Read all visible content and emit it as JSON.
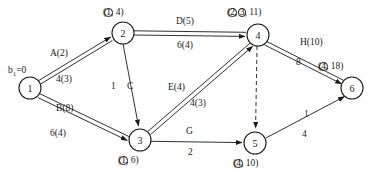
{
  "diagram": {
    "type": "network-flow-diagram",
    "title": "",
    "canvas": {
      "width": 379,
      "height": 180
    },
    "source_label": {
      "text": "b",
      "subscript": "1",
      "value": "=0",
      "full": "b₁=0"
    },
    "nodes": [
      {
        "id": "1",
        "number": "1",
        "cx": 30,
        "cy": 88,
        "r": 11,
        "tag": null
      },
      {
        "id": "2",
        "number": "2",
        "cx": 123,
        "cy": 33,
        "r": 11,
        "tag": {
          "text_before": "(",
          "circled": [
            "1"
          ],
          "plain": "4",
          "full": "(①, 4)"
        }
      },
      {
        "id": "3",
        "number": "3",
        "cx": 140,
        "cy": 140,
        "r": 11,
        "tag": {
          "text_before": "(",
          "circled": [
            "1"
          ],
          "plain": "6",
          "full": "(①, 6)"
        }
      },
      {
        "id": "4",
        "number": "4",
        "cx": 258,
        "cy": 35,
        "r": 11,
        "tag": {
          "text_before": "(",
          "circled": [
            "2",
            "3"
          ],
          "plain": "11",
          "full": "(②, ③, 11)"
        }
      },
      {
        "id": "5",
        "number": "5",
        "cx": 255,
        "cy": 143,
        "r": 11,
        "tag": {
          "text_before": "(",
          "circled": [
            "4"
          ],
          "plain": "10",
          "full": "(④, 10)"
        }
      },
      {
        "id": "6",
        "number": "6",
        "cx": 352,
        "cy": 88,
        "r": 11,
        "tag": {
          "text_before": "(",
          "circled": [
            "4"
          ],
          "plain": "18",
          "full": "(④, 18)"
        }
      }
    ],
    "edges": [
      {
        "id": "e-1-2",
        "from": "1",
        "to": "2",
        "name": "A(2)",
        "value": "4(3)",
        "style": "double",
        "arrow": true
      },
      {
        "id": "e-1-3",
        "from": "1",
        "to": "3",
        "name": "B(8)",
        "value": "6(4)",
        "style": "double",
        "arrow": true
      },
      {
        "id": "e-2-3",
        "from": "2",
        "to": "3",
        "name": "C",
        "value": "1",
        "style": "single",
        "arrow": true
      },
      {
        "id": "e-2-4",
        "from": "2",
        "to": "4",
        "name": "D(5)",
        "value": "6(4)",
        "style": "double",
        "arrow": true
      },
      {
        "id": "e-3-4",
        "from": "3",
        "to": "4",
        "name": "E(4)",
        "value": "4(3)",
        "style": "double",
        "arrow": true
      },
      {
        "id": "e-3-5",
        "from": "3",
        "to": "5",
        "name": "G",
        "value": "2",
        "style": "single",
        "arrow": true
      },
      {
        "id": "e-4-5",
        "from": "4",
        "to": "5",
        "name": "",
        "value": "",
        "style": "dashed",
        "arrow": true
      },
      {
        "id": "e-4-6",
        "from": "4",
        "to": "6",
        "name": "H(10)",
        "value": "8",
        "style": "double",
        "arrow": true
      },
      {
        "id": "e-5-6",
        "from": "5",
        "to": "6",
        "name": "1",
        "value": "4",
        "style": "single",
        "arrow": true
      }
    ],
    "node_tags": {
      "n2": "(①, 4)",
      "n3": "(①, 6)",
      "n4": "(②, ③, 11)",
      "n5": "(④, 10)",
      "n6": "(④, 18)"
    },
    "edge_labels": {
      "a_name": "A(2)",
      "a_val": "4(3)",
      "b_name": "B(8)",
      "b_val": "6(4)",
      "c_name": "C",
      "c_val": "1",
      "d_name": "D(5)",
      "d_val": "6(4)",
      "e_name": "E(4)",
      "e_val": "4(3)",
      "g_name": "G",
      "g_val": "2",
      "h_name": "H(10)",
      "h_val": "8",
      "i_name": "1",
      "i_val": "4"
    },
    "colors": {
      "stroke": "#1a1a1a",
      "fill": "#ffffff",
      "background": "#ffffff"
    }
  }
}
